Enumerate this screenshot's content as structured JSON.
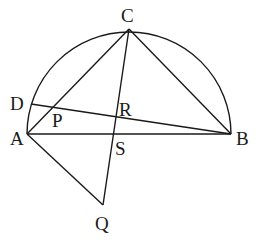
{
  "diagram": {
    "type": "geometry",
    "points": {
      "A": {
        "label": "A",
        "x": 27,
        "y": 134,
        "lx": 10,
        "ly": 145
      },
      "B": {
        "label": "B",
        "x": 231,
        "y": 134,
        "lx": 236,
        "ly": 145
      },
      "C": {
        "label": "C",
        "x": 129,
        "y": 29,
        "lx": 121,
        "ly": 22
      },
      "D": {
        "label": "D",
        "x": 31,
        "y": 104,
        "lx": 10,
        "ly": 110
      },
      "P": {
        "label": "P",
        "x": 53,
        "y": 107,
        "lx": 52,
        "ly": 127
      },
      "R": {
        "label": "R",
        "x": 116,
        "y": 117,
        "lx": 119,
        "ly": 116
      },
      "S": {
        "label": "S",
        "x": 114,
        "y": 134,
        "lx": 115,
        "ly": 155
      },
      "Q": {
        "label": "Q",
        "x": 103,
        "y": 205,
        "lx": 95,
        "ly": 230
      }
    },
    "segments": [
      [
        "A",
        "B"
      ],
      [
        "A",
        "C"
      ],
      [
        "B",
        "C"
      ],
      [
        "C",
        "Q"
      ],
      [
        "D",
        "B"
      ],
      [
        "A",
        "Q"
      ]
    ],
    "arc": {
      "from": "A",
      "to": "B",
      "center_x": 129,
      "center_y": 134,
      "radius": 102
    }
  }
}
